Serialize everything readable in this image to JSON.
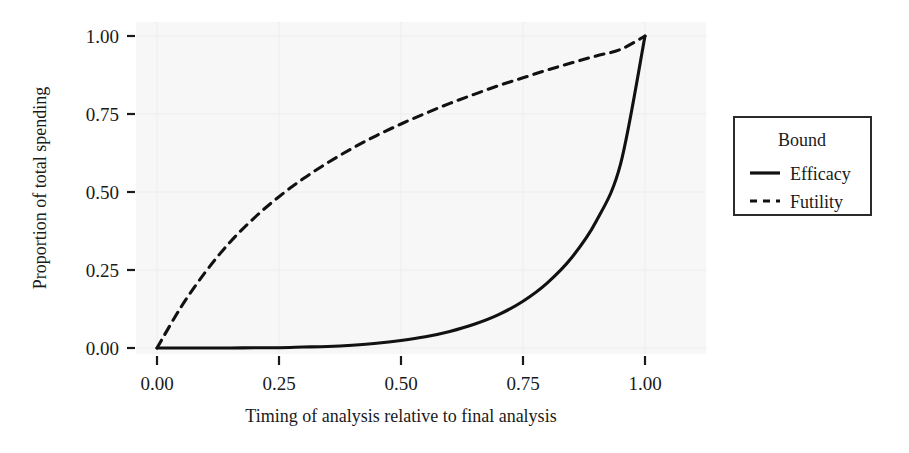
{
  "chart_data": {
    "type": "line",
    "title": "",
    "subtitle": "",
    "xlabel": "Timing of analysis relative to final analysis",
    "ylabel": "Proportion of total spending",
    "xlim": [
      -0.04,
      1.04
    ],
    "ylim": [
      -0.04,
      1.04
    ],
    "xticks": [
      0.0,
      0.25,
      0.5,
      0.75,
      1.0
    ],
    "xticklabels": [
      "0.00",
      "0.25",
      "0.50",
      "0.75",
      "1.00"
    ],
    "yticks": [
      0.0,
      0.25,
      0.5,
      0.75,
      1.0
    ],
    "yticklabels": [
      "0.00",
      "0.25",
      "0.50",
      "0.75",
      "1.00"
    ],
    "grid": true,
    "grid_color": "#ededed",
    "panel_background": "#f7f7f7",
    "legend": {
      "title": "Bound",
      "position": "right",
      "entries": [
        {
          "name": "Efficacy",
          "style": "solid",
          "color": "#111111"
        },
        {
          "name": "Futility",
          "style": "dashed",
          "color": "#111111"
        }
      ]
    },
    "x": [
      0.0,
      0.05,
      0.1,
      0.15,
      0.2,
      0.25,
      0.3,
      0.35,
      0.4,
      0.45,
      0.5,
      0.55,
      0.6,
      0.65,
      0.7,
      0.75,
      0.8,
      0.85,
      0.9,
      0.95,
      1.0
    ],
    "series": [
      {
        "name": "Efficacy",
        "style": "solid",
        "color": "#111111",
        "values": [
          0.0,
          0.0,
          0.0,
          0.0,
          0.001,
          0.001,
          0.003,
          0.005,
          0.009,
          0.015,
          0.024,
          0.036,
          0.053,
          0.076,
          0.107,
          0.15,
          0.209,
          0.29,
          0.406,
          0.59,
          1.0
        ]
      },
      {
        "name": "Futility",
        "style": "dashed",
        "color": "#111111",
        "values": [
          0.0,
          0.133,
          0.245,
          0.34,
          0.418,
          0.485,
          0.543,
          0.594,
          0.64,
          0.681,
          0.718,
          0.752,
          0.784,
          0.813,
          0.841,
          0.866,
          0.891,
          0.914,
          0.936,
          0.957,
          1.0
        ]
      }
    ]
  },
  "axes": {
    "y_label": "Proportion of total spending",
    "x_label": "Timing of analysis relative to final analysis",
    "x_tick_labels": [
      "0.00",
      "0.25",
      "0.50",
      "0.75",
      "1.00"
    ],
    "y_tick_labels": [
      "0.00",
      "0.25",
      "0.50",
      "0.75",
      "1.00"
    ]
  },
  "legend": {
    "title": "Bound",
    "items": [
      {
        "label": "Efficacy"
      },
      {
        "label": "Futility"
      }
    ]
  }
}
